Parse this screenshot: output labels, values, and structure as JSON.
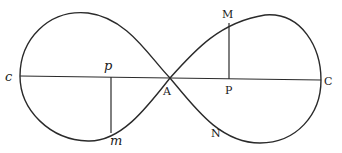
{
  "figure": {
    "type": "lemniscate-like curve with axis and ordinates",
    "labels": {
      "c": "c",
      "p": "p",
      "m": "m",
      "A": "A",
      "M": "M",
      "P": "P",
      "N": "N",
      "C": "C"
    },
    "colors": {
      "ink": "#2a2a2a",
      "background": "#ffffff"
    }
  }
}
